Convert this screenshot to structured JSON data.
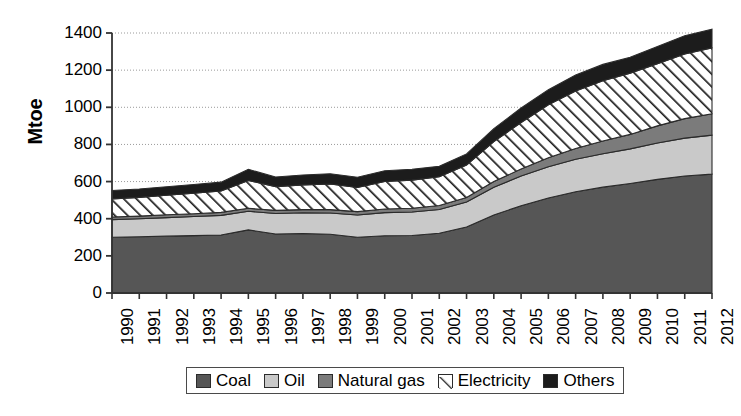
{
  "chart_data": {
    "type": "area",
    "title": "",
    "xlabel": "",
    "ylabel": "Mtoe",
    "ylim": [
      0,
      1400
    ],
    "ytick_step": 200,
    "yticks": [
      1400,
      1200,
      1000,
      800,
      600,
      400,
      200,
      0
    ],
    "grid": true,
    "stacked": true,
    "legend_position": "bottom",
    "categories": [
      "1990",
      "1991",
      "1992",
      "1993",
      "1994",
      "1995",
      "1996",
      "1997",
      "1998",
      "1999",
      "2000",
      "2001",
      "2002",
      "2003",
      "2004",
      "2005",
      "2006",
      "2007",
      "2008",
      "2009",
      "2010",
      "2011",
      "2012"
    ],
    "series": [
      {
        "name": "Coal",
        "color": "#565656",
        "pattern": "solid",
        "values": [
          300,
          303,
          306,
          309,
          312,
          340,
          318,
          320,
          316,
          300,
          308,
          310,
          322,
          355,
          420,
          470,
          512,
          545,
          570,
          590,
          612,
          630,
          640
        ]
      },
      {
        "name": "Oil",
        "color": "#c9c9c9",
        "pattern": "solid",
        "values": [
          95,
          97,
          100,
          103,
          106,
          100,
          110,
          112,
          115,
          120,
          125,
          126,
          128,
          135,
          150,
          160,
          168,
          175,
          180,
          186,
          196,
          204,
          210
        ]
      },
      {
        "name": "Natural gas",
        "color": "#7b7b7b",
        "pattern": "solid",
        "values": [
          14,
          14,
          15,
          15,
          16,
          16,
          17,
          17,
          18,
          18,
          19,
          20,
          21,
          24,
          30,
          38,
          48,
          58,
          68,
          78,
          92,
          105,
          115
        ]
      },
      {
        "name": "Electricity",
        "color": "#ffffff",
        "pattern": "diagonal-hatch",
        "values": [
          98,
          101,
          105,
          110,
          115,
          150,
          128,
          133,
          138,
          130,
          148,
          152,
          155,
          175,
          215,
          250,
          285,
          310,
          325,
          330,
          335,
          348,
          355
        ]
      },
      {
        "name": "Others",
        "color": "#1c1c1c",
        "pattern": "solid",
        "values": [
          45,
          45,
          46,
          47,
          48,
          60,
          52,
          53,
          55,
          55,
          58,
          58,
          56,
          60,
          70,
          78,
          82,
          86,
          88,
          85,
          92,
          98,
          100
        ]
      }
    ],
    "totals": [
      552,
      560,
      572,
      584,
      597,
      666,
      625,
      635,
      642,
      623,
      658,
      666,
      682,
      749,
      885,
      996,
      1095,
      1174,
      1231,
      1269,
      1327,
      1385,
      1420
    ]
  },
  "legend": {
    "items": [
      {
        "label": "Coal",
        "swatch": "coal-swatch"
      },
      {
        "label": "Oil",
        "swatch": "oil-swatch"
      },
      {
        "label": "Natural gas",
        "swatch": "natural-gas-swatch"
      },
      {
        "label": "Electricity",
        "swatch": "electricity-swatch"
      },
      {
        "label": "Others",
        "swatch": "others-swatch"
      }
    ]
  }
}
